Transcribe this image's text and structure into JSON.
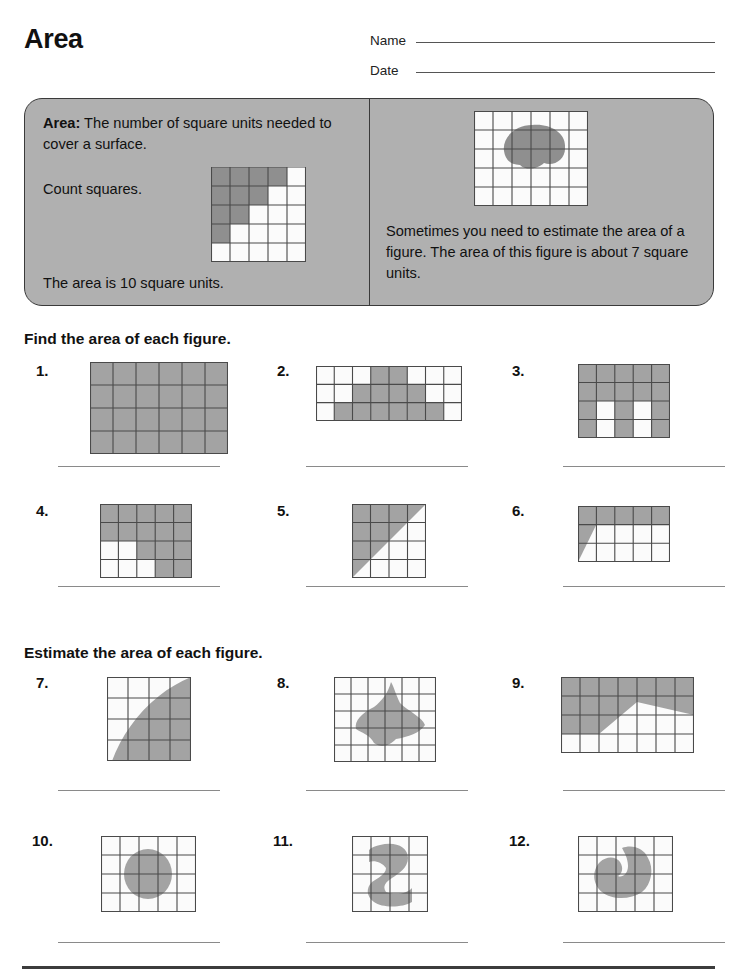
{
  "worksheet": {
    "title": "Area",
    "name_label": "Name",
    "date_label": "Date",
    "name_value": "",
    "date_value": ""
  },
  "definition": {
    "term": "Area:",
    "definition_text": " The number of square units needed to cover a surface.",
    "count_label": "Count squares.",
    "area_result": "The area is 10 square units.",
    "estimate_text": "Sometimes you need to estimate the area of a figure. The area of this figure is about 7 square units.",
    "example_grid": {
      "cols": 5,
      "rows": 5,
      "shaded_per_row": [
        4,
        3,
        2,
        1,
        0
      ],
      "area": 10
    },
    "example_blob": {
      "cols": 6,
      "rows": 5,
      "area": 7
    }
  },
  "sections": [
    {
      "heading": "Find the area of each figure."
    },
    {
      "heading": "Estimate the area of each figure."
    }
  ],
  "problems": [
    {
      "number": "1.",
      "cols": 6,
      "rows": 4,
      "kind": "cells",
      "answer_blank": ""
    },
    {
      "number": "2.",
      "cols": 8,
      "rows": 3,
      "kind": "cells",
      "answer_blank": ""
    },
    {
      "number": "3.",
      "cols": 5,
      "rows": 4,
      "kind": "cells",
      "answer_blank": ""
    },
    {
      "number": "4.",
      "cols": 5,
      "rows": 4,
      "kind": "cells",
      "answer_blank": ""
    },
    {
      "number": "5.",
      "cols": 4,
      "rows": 4,
      "kind": "polygon",
      "answer_blank": ""
    },
    {
      "number": "6.",
      "cols": 5,
      "rows": 3,
      "kind": "polygon",
      "answer_blank": ""
    },
    {
      "number": "7.",
      "cols": 4,
      "rows": 4,
      "kind": "curve",
      "answer_blank": ""
    },
    {
      "number": "8.",
      "cols": 6,
      "rows": 5,
      "kind": "curve",
      "answer_blank": ""
    },
    {
      "number": "9.",
      "cols": 7,
      "rows": 4,
      "kind": "polygon",
      "answer_blank": ""
    },
    {
      "number": "10.",
      "cols": 5,
      "rows": 4,
      "kind": "curve",
      "answer_blank": ""
    },
    {
      "number": "11.",
      "cols": 4,
      "rows": 4,
      "kind": "curve",
      "answer_blank": ""
    },
    {
      "number": "12.",
      "cols": 5,
      "rows": 4,
      "kind": "curve",
      "answer_blank": ""
    }
  ],
  "colors": {
    "shade": "#a3a3a3",
    "shade_dark": "#8f8f8f",
    "panel": "#b0b0b0",
    "grid_line": "#4a4a4a",
    "ink": "#111111",
    "rule": "#8a8a8a"
  }
}
